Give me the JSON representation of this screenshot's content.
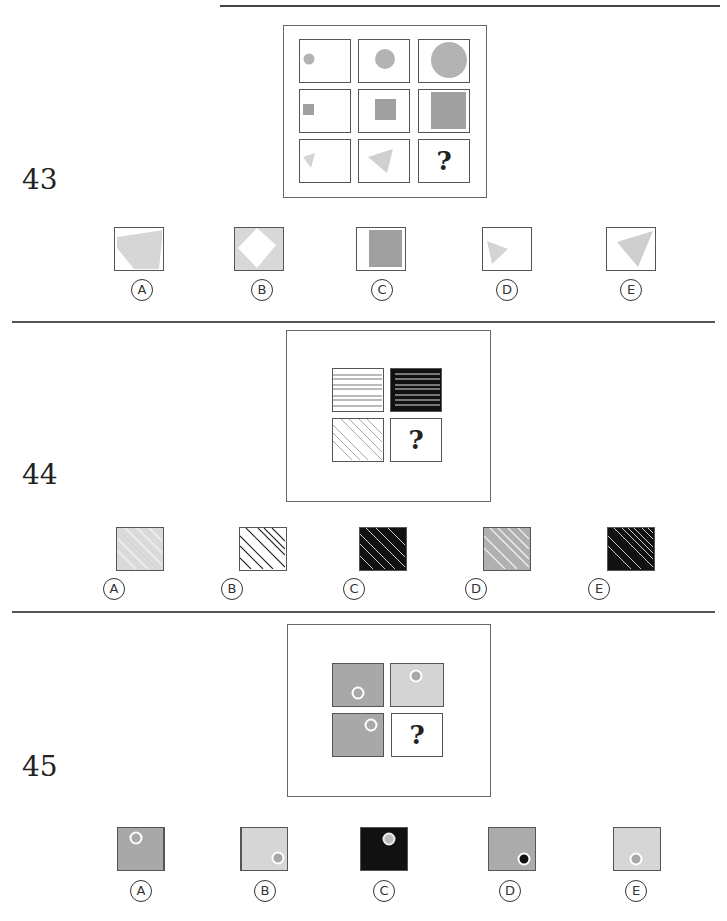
{
  "colors": {
    "shape_gray": "#b3b3b3",
    "shape_dark_gray": "#a0a0a0",
    "light_gray": "#d6d6d6",
    "mid_gray": "#b2b2b2",
    "black": "#111111",
    "border": "#555555"
  },
  "questions": [
    {
      "number": "43",
      "grid": {
        "rows": [
          [
            "small-circle",
            "medium-circle",
            "large-circle"
          ],
          [
            "small-square",
            "medium-square",
            "large-square"
          ],
          [
            "small-triangle",
            "medium-triangle",
            "?"
          ]
        ]
      },
      "question_mark": "?",
      "options": [
        {
          "label": "A",
          "glyph": "Ⓐ",
          "desc": "large light-gray quadrilateral"
        },
        {
          "label": "B",
          "glyph": "Ⓑ",
          "desc": "light-gray fill with white diamond"
        },
        {
          "label": "C",
          "glyph": "Ⓒ",
          "desc": "large dark-gray square"
        },
        {
          "label": "D",
          "glyph": "Ⓓ",
          "desc": "small light-gray triangle"
        },
        {
          "label": "E",
          "glyph": "Ⓔ",
          "desc": "large light-gray triangle"
        }
      ]
    },
    {
      "number": "44",
      "grid": {
        "rows": [
          [
            "white-horizontal-lines",
            "black-horizontal-lines"
          ],
          [
            "white-diagonal-lines",
            "?"
          ]
        ]
      },
      "question_mark": "?",
      "options": [
        {
          "label": "A",
          "glyph": "Ⓐ",
          "desc": "light gray with white diagonal lines"
        },
        {
          "label": "B",
          "glyph": "Ⓑ",
          "desc": "white with black diagonal lines"
        },
        {
          "label": "C",
          "glyph": "Ⓒ",
          "desc": "black with white diagonal lines"
        },
        {
          "label": "D",
          "glyph": "Ⓓ",
          "desc": "gray with white diagonal lines"
        },
        {
          "label": "E",
          "glyph": "Ⓔ",
          "desc": "black with dense white diagonal lines"
        }
      ]
    },
    {
      "number": "45",
      "grid": {
        "rows": [
          [
            "gray-circle-bottom-left",
            "light-circle-top-center"
          ],
          [
            "gray-circle-top-right",
            "?"
          ]
        ]
      },
      "question_mark": "?",
      "options": [
        {
          "label": "A",
          "glyph": "Ⓐ",
          "desc": "gray with ring top-left"
        },
        {
          "label": "B",
          "glyph": "Ⓑ",
          "desc": "light with ring bottom-right"
        },
        {
          "label": "C",
          "glyph": "Ⓒ",
          "desc": "black with ring top-right"
        },
        {
          "label": "D",
          "glyph": "Ⓓ",
          "desc": "gray with black-dot ring bottom-right"
        },
        {
          "label": "E",
          "glyph": "Ⓔ",
          "desc": "light with ring bottom-center"
        }
      ]
    }
  ]
}
